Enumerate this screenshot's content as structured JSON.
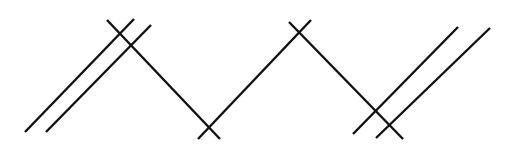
{
  "diagram": {
    "stroke_color": "#111111",
    "stroke_width": 2.4,
    "background": "#ffffff",
    "lines": [
      {
        "id": "left-parallel-outer",
        "x1": 25,
        "y1": 132,
        "x2": 134,
        "y2": 19
      },
      {
        "id": "left-parallel-inner",
        "x1": 46,
        "y1": 132,
        "x2": 151,
        "y2": 25
      },
      {
        "id": "zigzag-seg-1",
        "x1": 107,
        "y1": 20,
        "x2": 220,
        "y2": 139
      },
      {
        "id": "zigzag-seg-2",
        "x1": 198,
        "y1": 139,
        "x2": 311,
        "y2": 20
      },
      {
        "id": "zigzag-seg-3",
        "x1": 289,
        "y1": 22,
        "x2": 403,
        "y2": 139
      },
      {
        "id": "right-parallel-outer",
        "x1": 353,
        "y1": 134,
        "x2": 458,
        "y2": 27
      },
      {
        "id": "right-parallel-inner",
        "x1": 376,
        "y1": 138,
        "x2": 490,
        "y2": 28
      }
    ]
  }
}
